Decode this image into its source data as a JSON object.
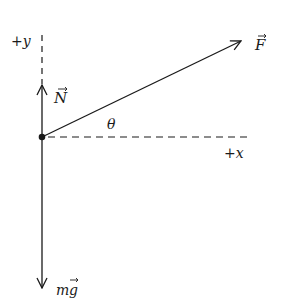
{
  "diagram": {
    "type": "free-body-diagram",
    "origin": {
      "x": 42,
      "y": 137
    },
    "axes": {
      "x_label": "+x",
      "y_label": "+y"
    },
    "vectors": [
      {
        "name": "applied-force",
        "label": "F",
        "direction": "up-right at angle theta"
      },
      {
        "name": "normal-force",
        "label": "N",
        "direction": "up"
      },
      {
        "name": "weight",
        "label": "mg",
        "direction": "down"
      }
    ],
    "angle_label": "θ",
    "colors": {
      "stroke": "#1a1a1a",
      "background": "#ffffff"
    }
  },
  "labels": {
    "y_axis": "+y",
    "x_axis": "+x",
    "force_F": "F",
    "force_N": "N",
    "weight_m": "m",
    "weight_g": "g",
    "theta": "θ"
  }
}
